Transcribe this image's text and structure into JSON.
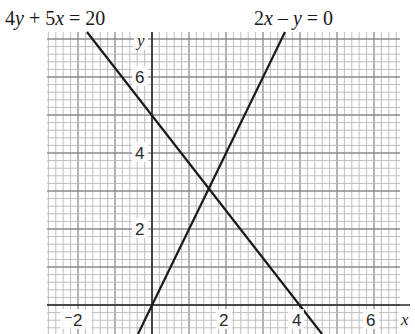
{
  "chart_data": {
    "type": "line",
    "title": "",
    "xlabel": "x",
    "ylabel": "y",
    "xlim": [
      -2.8,
      6.9
    ],
    "ylim": [
      -0.76,
      7.2
    ],
    "grid": true,
    "grid_minor_step": 0.2,
    "grid_major_step": 1,
    "x_ticks": [
      -2,
      2,
      4,
      6
    ],
    "x_tick_labels": [
      "⁻2",
      "2",
      "4",
      "6"
    ],
    "y_ticks": [
      2,
      4,
      6
    ],
    "y_tick_labels": [
      "2",
      "4",
      "6"
    ],
    "series": [
      {
        "name": "4y + 5x = 20",
        "equation": "y = 5 - 1.25x",
        "points": [
          [
            -1.76,
            7.2
          ],
          [
            0,
            5
          ],
          [
            4,
            0
          ],
          [
            4.61,
            -0.76
          ]
        ]
      },
      {
        "name": "2x − y = 0",
        "equation": "y = 2x",
        "points": [
          [
            -0.38,
            -0.76
          ],
          [
            0,
            0
          ],
          [
            3.6,
            7.2
          ]
        ]
      }
    ],
    "annotations": [
      {
        "text": "4y + 5x = 20",
        "position": "top-left"
      },
      {
        "text": "2x − y = 0",
        "position": "top-center-right"
      }
    ],
    "intersection": [
      1.54,
      3.08
    ]
  },
  "labels": {
    "eq1": {
      "p1": "4",
      "v1": "y",
      "p2": " + 5",
      "v2": "x",
      "p3": " = 20"
    },
    "eq2": {
      "p1": "2",
      "v1": "x",
      "p2": " – ",
      "v2": "y",
      "p3": " = 0"
    },
    "x_axis": "x",
    "y_axis": "y",
    "ticks": {
      "xm2": "⁻2",
      "x2": "2",
      "x4": "4",
      "x6": "6",
      "y2": "2",
      "y4": "4",
      "y6": "6"
    }
  },
  "colors": {
    "grid_minor": "#b8b8b8",
    "grid_major": "#8a8a8a",
    "axis": "#2a2a2a",
    "line": "#1a1a1a"
  }
}
